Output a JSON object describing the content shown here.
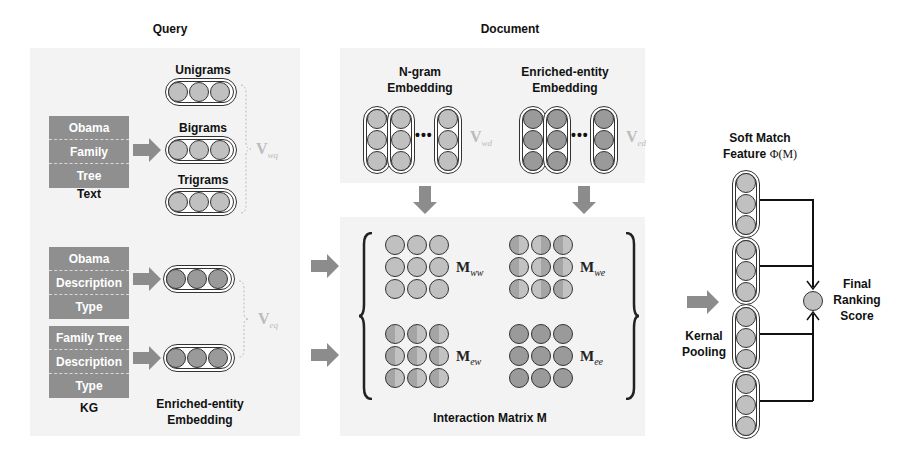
{
  "headers": {
    "query": "Query",
    "document": "Document"
  },
  "query": {
    "text_input": {
      "items": [
        "Obama",
        "Family",
        "Tree"
      ],
      "caption": "Text"
    },
    "ngrams": {
      "unigrams": "Unigrams",
      "bigrams": "Bigrams",
      "trigrams": "Trigrams",
      "vector_symbol": "V",
      "vector_subscript": "wq"
    },
    "kg_input": {
      "entity1": [
        "Obama",
        "Description",
        "Type"
      ],
      "entity2": [
        "Family Tree",
        "Description",
        "Type"
      ],
      "caption": "KG"
    },
    "entity_embedding": {
      "caption_line1": "Enriched-entity",
      "caption_line2": "Embedding",
      "vector_symbol": "V",
      "vector_subscript": "eq"
    }
  },
  "document": {
    "ngram_embedding": {
      "title_line1": "N-gram",
      "title_line2": "Embedding",
      "ellipsis": "•••",
      "vector_symbol": "V",
      "vector_subscript": "wd"
    },
    "entity_embedding": {
      "title_line1": "Enriched-entity",
      "title_line2": "Embedding",
      "ellipsis": "•••",
      "vector_symbol": "V",
      "vector_subscript": "ed"
    }
  },
  "interaction_matrix": {
    "caption": "Interaction Matrix M",
    "blocks": [
      {
        "symbol": "M",
        "subscript": "ww"
      },
      {
        "symbol": "M",
        "subscript": "we"
      },
      {
        "symbol": "M",
        "subscript": "ew"
      },
      {
        "symbol": "M",
        "subscript": "ee"
      }
    ]
  },
  "ranking": {
    "soft_match_line1": "Soft Match",
    "soft_match_line2": "Feature",
    "soft_match_phi": "Φ(M)",
    "kernel_pooling_line1": "Kernal",
    "kernel_pooling_line2": "Pooling",
    "final_line1": "Final",
    "final_line2": "Ranking",
    "final_line3": "Score"
  },
  "colors": {
    "panel_bg": "#f3f3f3",
    "input_box": "#8f8f8f",
    "node_light": "#c0c0c0",
    "node_dark": "#9a9a9a",
    "arrow": "#8c8c8c",
    "vector_label": "#bbbbbb"
  }
}
